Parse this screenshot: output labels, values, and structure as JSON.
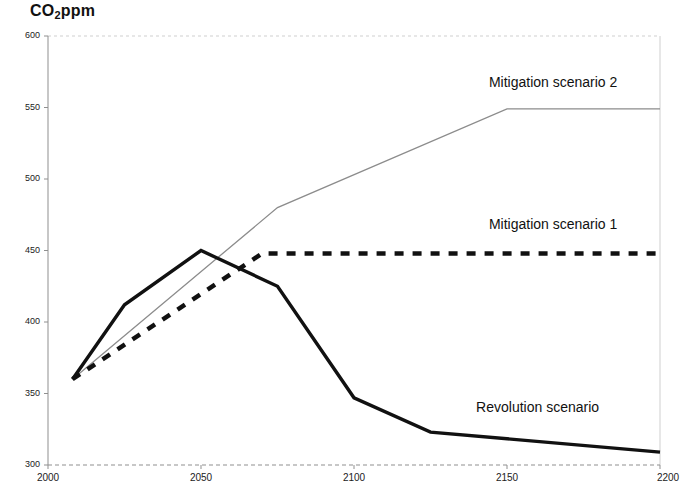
{
  "chart_data": {
    "type": "line",
    "title": "CO2ppm",
    "title_main": "CO",
    "title_sub": "2",
    "title_tail": "ppm",
    "xlabel": "",
    "ylabel": "CO2ppm",
    "xlim": [
      2000,
      2200
    ],
    "ylim": [
      300,
      600
    ],
    "grid": false,
    "legend_position": "inline-right",
    "xticks": [
      "2000",
      "2050",
      "2100",
      "2150",
      "2200"
    ],
    "xtick_values": [
      2000,
      2050,
      2100,
      2150,
      2200
    ],
    "yticks": [
      "300",
      "350",
      "400",
      "450",
      "500",
      "550",
      "600"
    ],
    "ytick_values": [
      300,
      350,
      400,
      450,
      500,
      550,
      600
    ],
    "series": [
      {
        "name": "Mitigation scenario 2",
        "style": "thin-solid-gray",
        "color": "#8c8c8c",
        "x": [
          2008,
          2075,
          2150,
          2200
        ],
        "values": [
          360,
          480,
          549,
          549
        ]
      },
      {
        "name": "Mitigation scenario 1",
        "style": "thick-dashed-black",
        "color": "#111111",
        "x": [
          2008,
          2070,
          2200
        ],
        "values": [
          360,
          448,
          448
        ]
      },
      {
        "name": "Revolution scenario",
        "style": "thick-solid-black",
        "color": "#111111",
        "x": [
          2008,
          2025,
          2050,
          2075,
          2100,
          2125,
          2200
        ],
        "values": [
          360,
          412,
          450,
          425,
          347,
          323,
          309
        ]
      }
    ],
    "annotations": [
      {
        "text": "Mitigation scenario 2",
        "x": 2165,
        "y": 567
      },
      {
        "text": "Mitigation scenario 1",
        "x": 2165,
        "y": 468
      },
      {
        "text": "Revolution scenario",
        "x": 2160,
        "y": 340
      }
    ]
  }
}
